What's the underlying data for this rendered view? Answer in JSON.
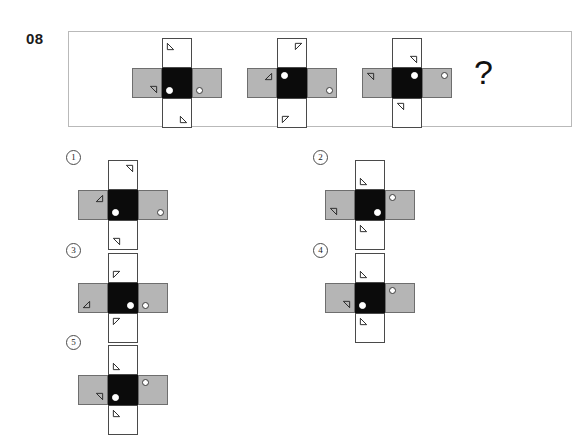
{
  "question": {
    "number": "08",
    "prompt_symbol": "?"
  },
  "figure_legend": {
    "white_cell": "#ffffff",
    "gray_cell": "#b5b5b5",
    "black_cell": "#0b0b0b",
    "outline": "#4a4a4a",
    "box_border": "#b9b9b9"
  },
  "stem": {
    "figures": [
      {
        "name": "stem-figure-1",
        "cells": {
          "top": {
            "fill": "white",
            "markers": [
              {
                "shape": "triangle-flag",
                "pos": "tl",
                "rot": 0
              }
            ]
          },
          "left": {
            "fill": "gray",
            "markers": [
              {
                "shape": "triangle-flag",
                "pos": "br",
                "rot": 180
              }
            ]
          },
          "center": {
            "fill": "black",
            "markers": [
              {
                "shape": "dot-solid-white",
                "pos": "bl"
              }
            ]
          },
          "right": {
            "fill": "gray",
            "markers": [
              {
                "shape": "dot-ring",
                "pos": "bl"
              }
            ]
          },
          "bottom": {
            "fill": "white",
            "markers": [
              {
                "shape": "triangle-flag",
                "pos": "br",
                "rot": 0
              }
            ]
          }
        }
      },
      {
        "name": "stem-figure-2",
        "cells": {
          "top": {
            "fill": "white",
            "markers": [
              {
                "shape": "triangle-flag",
                "pos": "tr",
                "rot": 90
              }
            ]
          },
          "left": {
            "fill": "gray",
            "markers": [
              {
                "shape": "triangle-flag",
                "pos": "tr",
                "rot": 270
              }
            ]
          },
          "center": {
            "fill": "black",
            "markers": [
              {
                "shape": "dot-solid-white",
                "pos": "tl"
              }
            ]
          },
          "right": {
            "fill": "gray",
            "markers": [
              {
                "shape": "dot-ring",
                "pos": "br"
              }
            ]
          },
          "bottom": {
            "fill": "white",
            "markers": [
              {
                "shape": "triangle-flag",
                "pos": "bl",
                "rot": 90
              }
            ]
          }
        }
      },
      {
        "name": "stem-figure-3",
        "cells": {
          "top": {
            "fill": "white",
            "markers": [
              {
                "shape": "triangle-flag",
                "pos": "br",
                "rot": 180
              }
            ]
          },
          "left": {
            "fill": "gray",
            "markers": [
              {
                "shape": "triangle-flag",
                "pos": "tl",
                "rot": 180
              }
            ]
          },
          "center": {
            "fill": "black",
            "markers": [
              {
                "shape": "dot-solid-white",
                "pos": "tr"
              }
            ]
          },
          "right": {
            "fill": "gray",
            "markers": [
              {
                "shape": "dot-ring",
                "pos": "tr"
              }
            ]
          },
          "bottom": {
            "fill": "white",
            "markers": [
              {
                "shape": "triangle-flag",
                "pos": "tl",
                "rot": 180
              }
            ]
          }
        }
      }
    ]
  },
  "options": [
    {
      "label": "1",
      "name": "option-1",
      "cells": {
        "top": {
          "fill": "white",
          "markers": [
            {
              "shape": "triangle-flag",
              "pos": "tr",
              "rot": 180
            }
          ]
        },
        "left": {
          "fill": "gray",
          "markers": [
            {
              "shape": "triangle-flag",
              "pos": "tr",
              "rot": 270
            }
          ]
        },
        "center": {
          "fill": "black",
          "markers": [
            {
              "shape": "dot-solid-white",
              "pos": "bl"
            }
          ]
        },
        "right": {
          "fill": "gray",
          "markers": [
            {
              "shape": "dot-ring",
              "pos": "br"
            }
          ]
        },
        "bottom": {
          "fill": "white",
          "markers": [
            {
              "shape": "triangle-flag",
              "pos": "bl",
              "rot": 180
            }
          ]
        }
      }
    },
    {
      "label": "2",
      "name": "option-2",
      "cells": {
        "top": {
          "fill": "white",
          "markers": [
            {
              "shape": "triangle-flag",
              "pos": "bl",
              "rot": 0
            }
          ]
        },
        "left": {
          "fill": "gray",
          "markers": [
            {
              "shape": "triangle-flag",
              "pos": "bl",
              "rot": 180
            }
          ]
        },
        "center": {
          "fill": "black",
          "markers": [
            {
              "shape": "dot-solid-white",
              "pos": "br"
            }
          ]
        },
        "right": {
          "fill": "gray",
          "markers": [
            {
              "shape": "dot-ring",
              "pos": "tl"
            }
          ]
        },
        "bottom": {
          "fill": "white",
          "markers": [
            {
              "shape": "triangle-flag",
              "pos": "tl",
              "rot": 0
            }
          ]
        }
      }
    },
    {
      "label": "3",
      "name": "option-3",
      "cells": {
        "top": {
          "fill": "white",
          "markers": [
            {
              "shape": "triangle-flag",
              "pos": "bl",
              "rot": 90
            }
          ]
        },
        "left": {
          "fill": "gray",
          "markers": [
            {
              "shape": "triangle-flag",
              "pos": "bl",
              "rot": 270
            }
          ]
        },
        "center": {
          "fill": "black",
          "markers": [
            {
              "shape": "dot-solid-white",
              "pos": "br"
            }
          ]
        },
        "right": {
          "fill": "gray",
          "markers": [
            {
              "shape": "dot-ring",
              "pos": "bl"
            }
          ]
        },
        "bottom": {
          "fill": "white",
          "markers": [
            {
              "shape": "triangle-flag",
              "pos": "tl",
              "rot": 90
            }
          ]
        }
      }
    },
    {
      "label": "4",
      "name": "option-4",
      "cells": {
        "top": {
          "fill": "white",
          "markers": [
            {
              "shape": "triangle-flag",
              "pos": "bl",
              "rot": 0
            }
          ]
        },
        "left": {
          "fill": "gray",
          "markers": [
            {
              "shape": "triangle-flag",
              "pos": "br",
              "rot": 180
            }
          ]
        },
        "center": {
          "fill": "black",
          "markers": [
            {
              "shape": "dot-solid-white",
              "pos": "bl"
            }
          ]
        },
        "right": {
          "fill": "gray",
          "markers": [
            {
              "shape": "dot-ring",
              "pos": "tl"
            }
          ]
        },
        "bottom": {
          "fill": "white",
          "markers": [
            {
              "shape": "triangle-flag",
              "pos": "tl",
              "rot": 0
            }
          ]
        }
      }
    },
    {
      "label": "5",
      "name": "option-5",
      "cells": {
        "top": {
          "fill": "white",
          "markers": [
            {
              "shape": "triangle-flag",
              "pos": "bl",
              "rot": 0
            }
          ]
        },
        "left": {
          "fill": "gray",
          "markers": [
            {
              "shape": "triangle-flag",
              "pos": "br",
              "rot": 180
            }
          ]
        },
        "center": {
          "fill": "black",
          "markers": [
            {
              "shape": "dot-solid-white",
              "pos": "bl"
            }
          ]
        },
        "right": {
          "fill": "gray",
          "markers": [
            {
              "shape": "dot-ring",
              "pos": "tl"
            }
          ]
        },
        "bottom": {
          "fill": "white",
          "markers": [
            {
              "shape": "triangle-flag",
              "pos": "tl",
              "rot": 0
            }
          ]
        }
      }
    }
  ],
  "layout": {
    "stem_figure_positions": [
      [
        132,
        38
      ],
      [
        247,
        38
      ],
      [
        362,
        38
      ]
    ],
    "option_positions": [
      [
        78,
        160
      ],
      [
        325,
        160
      ],
      [
        78,
        253
      ],
      [
        325,
        253
      ],
      [
        78,
        345
      ]
    ],
    "option_label_positions": [
      [
        66,
        150
      ],
      [
        313,
        150
      ],
      [
        66,
        243
      ],
      [
        313,
        243
      ],
      [
        66,
        335
      ]
    ]
  }
}
